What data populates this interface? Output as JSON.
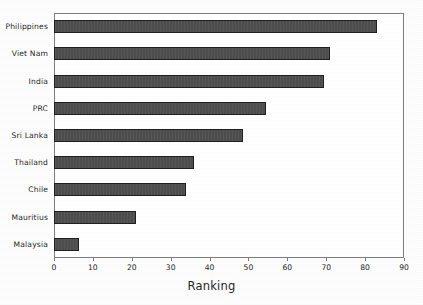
{
  "chart_data": {
    "type": "bar",
    "orientation": "horizontal",
    "title": "",
    "xlabel": "Ranking",
    "ylabel": "",
    "xlim": [
      0,
      90
    ],
    "xticks": [
      0,
      10,
      20,
      30,
      40,
      50,
      60,
      70,
      80,
      90
    ],
    "grid": false,
    "legend": null,
    "categories": [
      "Philippines",
      "Viet Nam",
      "India",
      "PRC",
      "Sri Lanka",
      "Thailand",
      "Chile",
      "Mauritius",
      "Malaysia"
    ],
    "values": [
      83,
      71,
      69.5,
      54.5,
      48.5,
      36,
      34,
      21,
      6.5
    ],
    "series": [
      {
        "name": "Ranking",
        "values": [
          83,
          71,
          69.5,
          54.5,
          48.5,
          36,
          34,
          21,
          6.5
        ]
      }
    ]
  },
  "style": {
    "bar_fill": "#4d4d4d",
    "bar_border": "#1f1f1f",
    "frame_color": "#7d7d7d",
    "text_color": "#262626",
    "background": "#ffffff"
  }
}
